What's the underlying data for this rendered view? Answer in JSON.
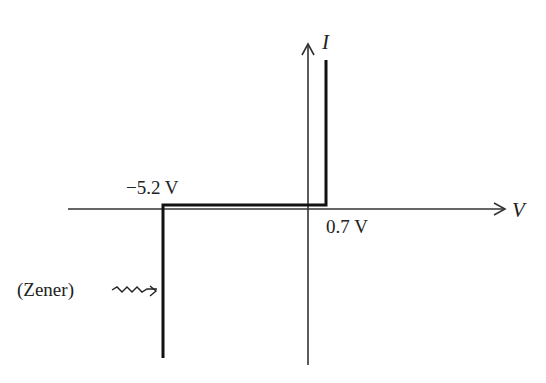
{
  "diagram": {
    "axes": {
      "x_label": "V",
      "y_label": "I"
    },
    "annotations": {
      "reverse_breakdown": "−5.2 V",
      "forward_voltage": "0.7 V",
      "zener_label": "(Zener)"
    },
    "colors": {
      "axis": "#333333",
      "curve": "#111111",
      "text": "#222222"
    }
  }
}
